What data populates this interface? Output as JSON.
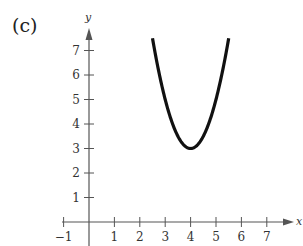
{
  "panel_label": "(c)",
  "chart_data": {
    "type": "line",
    "title": "",
    "xlabel": "x",
    "ylabel": "y",
    "xlim": [
      -1,
      7
    ],
    "ylim": [
      0,
      7
    ],
    "x_ticks": [
      -1,
      1,
      2,
      3,
      4,
      5,
      6,
      7
    ],
    "y_ticks": [
      1,
      2,
      3,
      4,
      5,
      6,
      7
    ],
    "grid": false,
    "legend": null,
    "series": [
      {
        "name": "parabola",
        "equation": "y = 2(x - 4)^2 + 3",
        "vertex": [
          4,
          3
        ],
        "x": [
          2.5,
          2.75,
          3.0,
          3.25,
          3.5,
          3.75,
          4.0,
          4.25,
          4.5,
          4.75,
          5.0,
          5.25,
          5.5
        ],
        "values": [
          7.5,
          6.125,
          5.0,
          4.125,
          3.5,
          3.125,
          3.0,
          3.125,
          3.5,
          4.125,
          5.0,
          6.125,
          7.5
        ],
        "color": "#111111"
      }
    ]
  }
}
